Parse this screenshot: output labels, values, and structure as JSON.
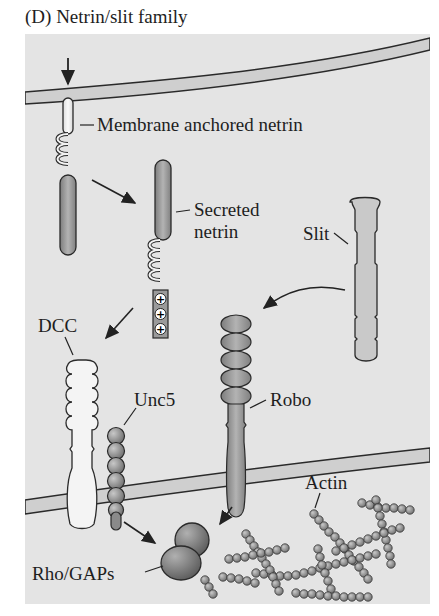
{
  "figure": {
    "title": "(D) Netrin/slit family",
    "labels": {
      "membrane_anchored_netrin": "Membrane anchored netrin",
      "secreted_netrin_line1": "Secreted",
      "secreted_netrin_line2": "netrin",
      "slit": "Slit",
      "dcc": "DCC",
      "unc5": "Unc5",
      "robo": "Robo",
      "actin": "Actin",
      "rho_gaps": "Rho/GAPs"
    },
    "charge_symbols": [
      "+",
      "+",
      "+"
    ],
    "colors": {
      "background_panel": "#e4e4e4",
      "membrane": "#cfcfcf",
      "protein_dark": "#9a9a9a",
      "protein_light": "#f2f2f2",
      "outline": "#2a2a2a"
    }
  }
}
